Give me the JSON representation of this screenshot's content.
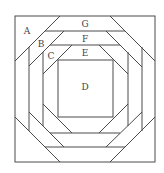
{
  "figure": {
    "type": "quilt-block-diagram",
    "line_color": "#4a4a4a",
    "background": "#ffffff"
  },
  "labels": {
    "A": "A",
    "B": "B",
    "C": "C",
    "D": "D",
    "E": "E",
    "F": "F",
    "G": "G"
  },
  "pieces": [
    {
      "id": "A",
      "shape": "corner triangle",
      "ring": "outer corner"
    },
    {
      "id": "B",
      "shape": "diagonal strip",
      "ring": 2
    },
    {
      "id": "C",
      "shape": "diagonal strip",
      "ring": 3
    },
    {
      "id": "D",
      "shape": "center square",
      "ring": "center"
    },
    {
      "id": "E",
      "shape": "trapezoid strip",
      "ring": 3
    },
    {
      "id": "F",
      "shape": "trapezoid strip",
      "ring": 2
    },
    {
      "id": "G",
      "shape": "trapezoid strip",
      "ring": 1
    }
  ]
}
